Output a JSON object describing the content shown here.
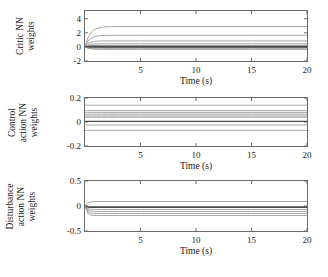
{
  "figure": {
    "background": "#ffffff",
    "colors": {
      "line": "#8f8f8f",
      "line_dark": "#4a4a4a",
      "axis": "#6b6b6b",
      "text": "#1a1a1a"
    }
  },
  "chart_data": [
    {
      "type": "line",
      "title": "",
      "ylabel_lines": [
        "Critic NN",
        "weights"
      ],
      "xlabel": "Time (s)",
      "xlim": [
        0,
        20
      ],
      "ylim": [
        -2,
        5.1
      ],
      "grid": false,
      "legend": "none",
      "xticks": [
        {
          "v": 5,
          "label": "5"
        },
        {
          "v": 10,
          "label": "10"
        },
        {
          "v": 15,
          "label": "15"
        },
        {
          "v": 20,
          "label": "20"
        }
      ],
      "yticks": [
        {
          "v": -2,
          "label": "-2"
        },
        {
          "v": 0,
          "label": "0"
        },
        {
          "v": 2,
          "label": "2"
        },
        {
          "v": 4,
          "label": "4"
        }
      ],
      "x": [
        0,
        0.25,
        0.5,
        0.75,
        1,
        1.5,
        2,
        3,
        5,
        10,
        15,
        20
      ],
      "series": [
        {
          "name": "weight-1",
          "shade": "normal",
          "y": [
            0,
            1.24,
            1.94,
            2.36,
            2.58,
            2.79,
            2.86,
            2.9,
            2.9,
            2.9,
            2.9,
            2.9
          ]
        },
        {
          "name": "weight-2",
          "shade": "normal",
          "y": [
            0,
            0.77,
            1.18,
            1.4,
            1.53,
            1.62,
            1.64,
            1.65,
            1.65,
            1.65,
            1.65,
            1.65
          ]
        },
        {
          "name": "weight-3",
          "shade": "normal",
          "y": [
            0,
            0.43,
            0.65,
            0.75,
            0.8,
            0.84,
            0.85,
            0.85,
            0.85,
            0.85,
            0.85,
            0.85
          ]
        },
        {
          "name": "weight-4",
          "shade": "normal",
          "y": [
            0,
            0.25,
            0.36,
            0.41,
            0.43,
            0.45,
            0.45,
            0.45,
            0.45,
            0.45,
            0.45,
            0.45
          ]
        },
        {
          "name": "weight-5",
          "shade": "normal",
          "y": [
            0,
            0.14,
            0.19,
            0.21,
            0.22,
            0.22,
            0.22,
            0.22,
            0.22,
            0.22,
            0.22,
            0.22
          ]
        },
        {
          "name": "weight-6",
          "shade": "dark",
          "y": [
            0,
            0.06,
            0.07,
            0.07,
            0.07,
            0.07,
            0.07,
            0.07,
            0.07,
            0.07,
            0.07,
            0.07
          ]
        },
        {
          "name": "weight-7",
          "shade": "dark",
          "y": [
            0,
            -0.01,
            -0.01,
            -0.01,
            -0.01,
            -0.01,
            -0.01,
            -0.01,
            -0.01,
            -0.01,
            -0.01,
            -0.01
          ]
        },
        {
          "name": "weight-8",
          "shade": "dark",
          "y": [
            0,
            -0.04,
            -0.05,
            -0.05,
            -0.05,
            -0.05,
            -0.05,
            -0.05,
            -0.05,
            -0.05,
            -0.05,
            -0.05
          ]
        },
        {
          "name": "weight-9",
          "shade": "normal",
          "y": [
            0,
            -0.12,
            -0.17,
            -0.19,
            -0.2,
            -0.2,
            -0.2,
            -0.2,
            -0.2,
            -0.2,
            -0.2,
            -0.2
          ]
        },
        {
          "name": "weight-10",
          "shade": "normal",
          "y": [
            0,
            -0.18,
            -0.27,
            -0.31,
            -0.33,
            -0.35,
            -0.35,
            -0.35,
            -0.35,
            -0.35,
            -0.35,
            -0.35
          ]
        }
      ]
    },
    {
      "type": "line",
      "title": "",
      "ylabel_lines": [
        "Control",
        "action NN",
        "weights"
      ],
      "xlabel": "Time (s)",
      "xlim": [
        0,
        20
      ],
      "ylim": [
        -0.2,
        0.2
      ],
      "grid": false,
      "legend": "none",
      "xticks": [
        {
          "v": 5,
          "label": "5"
        },
        {
          "v": 10,
          "label": "10"
        },
        {
          "v": 15,
          "label": "15"
        },
        {
          "v": 20,
          "label": "20"
        }
      ],
      "yticks": [
        {
          "v": -0.2,
          "label": "-0.2"
        },
        {
          "v": 0,
          "label": "0"
        },
        {
          "v": 0.2,
          "label": "0.2"
        }
      ],
      "x": [
        0,
        0.25,
        0.5,
        0.75,
        1,
        1.5,
        2,
        3,
        5,
        10,
        15,
        20
      ],
      "series": [
        {
          "name": "weight-1",
          "shade": "normal",
          "y": [
            0.14,
            0.14,
            0.14,
            0.14,
            0.14,
            0.14,
            0.14,
            0.14,
            0.14,
            0.14,
            0.14,
            0.14
          ]
        },
        {
          "name": "weight-2",
          "shade": "normal",
          "y": [
            0.095,
            0.095,
            0.095,
            0.095,
            0.095,
            0.095,
            0.095,
            0.095,
            0.095,
            0.095,
            0.095,
            0.095
          ]
        },
        {
          "name": "weight-3",
          "shade": "normal",
          "y": [
            0.08,
            0.08,
            0.08,
            0.08,
            0.08,
            0.08,
            0.08,
            0.08,
            0.08,
            0.08,
            0.08,
            0.08
          ]
        },
        {
          "name": "weight-4",
          "shade": "normal",
          "y": [
            0.065,
            0.065,
            0.065,
            0.065,
            0.065,
            0.065,
            0.065,
            0.065,
            0.065,
            0.065,
            0.065,
            0.065
          ]
        },
        {
          "name": "weight-5",
          "shade": "normal",
          "y": [
            0.05,
            0.05,
            0.05,
            0.05,
            0.05,
            0.05,
            0.05,
            0.05,
            0.05,
            0.05,
            0.05,
            0.05
          ]
        },
        {
          "name": "weight-6",
          "shade": "normal",
          "y": [
            0.04,
            0.04,
            0.04,
            0.04,
            0.04,
            0.04,
            0.04,
            0.04,
            0.04,
            0.04,
            0.04,
            0.04
          ]
        },
        {
          "name": "weight-7",
          "shade": "dark",
          "y": [
            0.005,
            0.005,
            0.005,
            0.005,
            0.005,
            0.005,
            0.005,
            0.005,
            0.005,
            0.005,
            0.005,
            0.005
          ]
        },
        {
          "name": "weight-8",
          "shade": "normal",
          "y": [
            -0.025,
            -0.025,
            -0.025,
            -0.025,
            -0.025,
            -0.025,
            -0.025,
            -0.025,
            -0.025,
            -0.025,
            -0.025,
            -0.025
          ]
        },
        {
          "name": "weight-9",
          "shade": "normal",
          "y": [
            -0.07,
            -0.07,
            -0.07,
            -0.07,
            -0.07,
            -0.07,
            -0.07,
            -0.07,
            -0.07,
            -0.07,
            -0.07,
            -0.07
          ]
        }
      ]
    },
    {
      "type": "line",
      "title": "",
      "ylabel_lines": [
        "Disturbance",
        "action NN",
        "weights"
      ],
      "xlabel": "Time (s)",
      "xlim": [
        0,
        20
      ],
      "ylim": [
        -0.5,
        0.5
      ],
      "grid": false,
      "legend": "none",
      "xticks": [
        {
          "v": 5,
          "label": "5"
        },
        {
          "v": 10,
          "label": "10"
        },
        {
          "v": 15,
          "label": "15"
        },
        {
          "v": 20,
          "label": "20"
        }
      ],
      "yticks": [
        {
          "v": -0.5,
          "label": "-0.5"
        },
        {
          "v": 0,
          "label": "0"
        },
        {
          "v": 0.5,
          "label": "0.5"
        }
      ],
      "x": [
        0,
        0.25,
        0.5,
        0.75,
        1,
        1.5,
        2,
        3,
        5,
        10,
        15,
        20
      ],
      "series": [
        {
          "name": "weight-1",
          "shade": "normal",
          "y": [
            0,
            0.06,
            0.08,
            0.09,
            0.09,
            0.09,
            0.09,
            0.09,
            0.09,
            0.09,
            0.09,
            0.09
          ]
        },
        {
          "name": "weight-2",
          "shade": "dark",
          "y": [
            0,
            -0.01,
            -0.015,
            -0.015,
            -0.015,
            -0.015,
            -0.015,
            -0.015,
            -0.015,
            -0.015,
            -0.015,
            -0.015
          ]
        },
        {
          "name": "weight-3",
          "shade": "dark",
          "y": [
            0,
            -0.025,
            -0.03,
            -0.03,
            -0.03,
            -0.03,
            -0.03,
            -0.03,
            -0.03,
            -0.03,
            -0.03,
            -0.03
          ]
        },
        {
          "name": "weight-4",
          "shade": "normal",
          "y": [
            0,
            -0.05,
            -0.065,
            -0.07,
            -0.07,
            -0.07,
            -0.07,
            -0.07,
            -0.07,
            -0.07,
            -0.07,
            -0.07
          ]
        },
        {
          "name": "weight-5",
          "shade": "normal",
          "y": [
            0,
            -0.08,
            -0.1,
            -0.11,
            -0.11,
            -0.11,
            -0.11,
            -0.11,
            -0.11,
            -0.11,
            -0.11,
            -0.11
          ]
        },
        {
          "name": "weight-6",
          "shade": "normal",
          "y": [
            0,
            -0.11,
            -0.14,
            -0.15,
            -0.15,
            -0.15,
            -0.15,
            -0.15,
            -0.15,
            -0.15,
            -0.15,
            -0.15
          ]
        },
        {
          "name": "weight-7",
          "shade": "normal",
          "y": [
            0,
            -0.145,
            -0.18,
            -0.19,
            -0.19,
            -0.19,
            -0.19,
            -0.19,
            -0.19,
            -0.19,
            -0.19,
            -0.19
          ]
        }
      ]
    }
  ]
}
